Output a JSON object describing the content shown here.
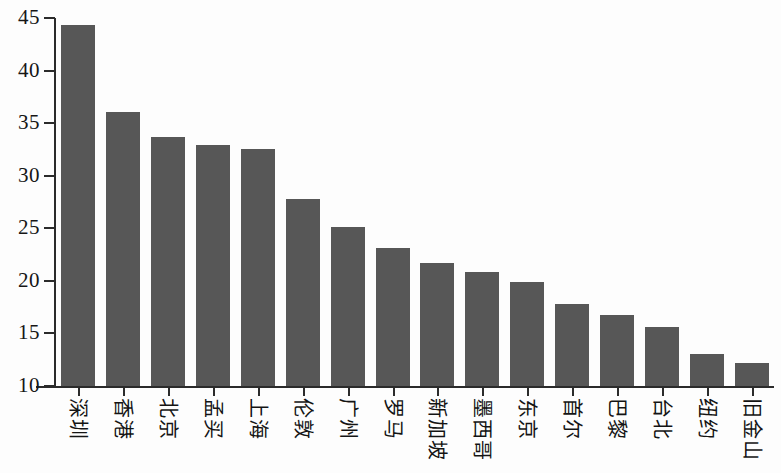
{
  "chart_data": {
    "type": "bar",
    "title": "",
    "xlabel": "",
    "ylabel": "",
    "ylim": [
      10,
      45
    ],
    "y_ticks": [
      10,
      15,
      20,
      25,
      30,
      35,
      40,
      45
    ],
    "grid": false,
    "legend": "none",
    "bar_color": "#575757",
    "axis_color": "#2b2b2b",
    "categories": [
      "深圳",
      "香港",
      "北京",
      "孟买",
      "上海",
      "伦敦",
      "广州",
      "罗马",
      "新加坡",
      "墨西哥",
      "东京",
      "首尔",
      "巴黎",
      "台北",
      "纽约",
      "旧金山"
    ],
    "values": [
      44.3,
      36.1,
      33.7,
      32.9,
      32.5,
      27.8,
      25.1,
      23.1,
      21.7,
      20.8,
      19.9,
      17.8,
      16.8,
      15.6,
      13.0,
      12.2
    ]
  }
}
